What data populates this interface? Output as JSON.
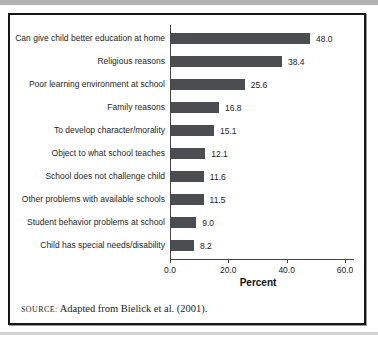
{
  "chart_data": {
    "type": "bar",
    "orientation": "horizontal",
    "title": "",
    "categories": [
      "Can give child better education at home",
      "Religious reasons",
      "Poor learning environment at school",
      "Family reasons",
      "To develop character/morality",
      "Object to what school teaches",
      "School does not challenge child",
      "Other problems with available schools",
      "Student behavior problems at school",
      "Child has special needs/disability"
    ],
    "values": [
      48.0,
      38.4,
      25.6,
      16.8,
      15.1,
      12.1,
      11.6,
      11.5,
      9.0,
      8.2
    ],
    "value_labels": [
      "48.0",
      "38.4",
      "25.6",
      "16.8",
      "15.1",
      "12.1",
      "11.6",
      "11.5",
      "9.0",
      "8.2"
    ],
    "xlabel": "Percent",
    "ylabel": "",
    "xlim": [
      0,
      60
    ],
    "xticks": [
      "0.0",
      "20.0",
      "40.0",
      "60.0"
    ],
    "xtick_values": [
      0,
      20,
      40,
      60
    ],
    "grid": false,
    "legend_position": "none",
    "bar_color": "#4c4d51"
  },
  "source_note": {
    "label": "SOURCE:",
    "text": " Adapted from Bielick et al. (2001)."
  }
}
